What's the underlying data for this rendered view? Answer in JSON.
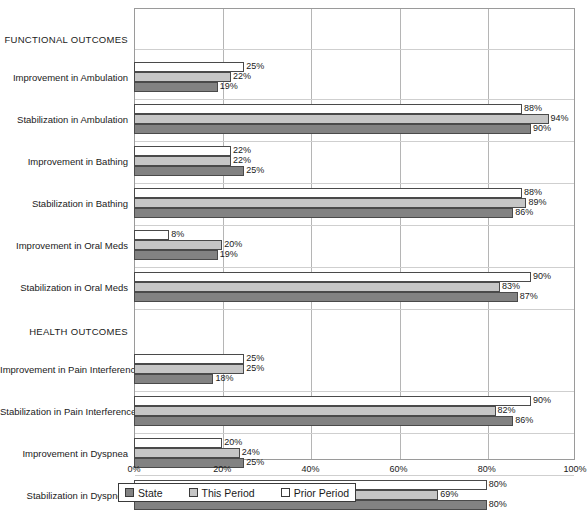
{
  "chart_data": {
    "type": "bar",
    "orientation": "horizontal",
    "title": "",
    "xlabel": "",
    "ylabel": "",
    "xlim": [
      0,
      100
    ],
    "xticks": [
      "0%",
      "20%",
      "40%",
      "60%",
      "80%",
      "100%"
    ],
    "xtick_values": [
      0,
      20,
      40,
      60,
      80,
      100
    ],
    "grid": true,
    "legend_position": "bottom",
    "legend": [
      "State",
      "This Period",
      "Prior Period"
    ],
    "series": [
      {
        "name": "Prior Period",
        "color": "#ffffff",
        "values": [
          25,
          88,
          22,
          88,
          8,
          90,
          25,
          90,
          20,
          80
        ]
      },
      {
        "name": "This Period",
        "color": "#c6c6c6",
        "values": [
          22,
          94,
          22,
          89,
          20,
          83,
          25,
          82,
          24,
          69
        ]
      },
      {
        "name": "State",
        "color": "#828282",
        "values": [
          19,
          90,
          25,
          86,
          19,
          87,
          18,
          86,
          25,
          80
        ]
      }
    ],
    "categories": [
      "Improvement in Ambulation",
      "Stabilization in Ambulation",
      "Improvement in Bathing",
      "Stabilization in Bathing",
      "Improvement in Oral Meds",
      "Stabilization in Oral Meds",
      "Improvement in Pain Interference",
      "Stabilization in Pain Interference",
      "Improvement in Dyspnea",
      "Stabilization in Dyspnea"
    ],
    "sections": [
      {
        "label": "FUNCTIONAL OUTCOMES",
        "categories": [
          0,
          1,
          2,
          3,
          4,
          5
        ]
      },
      {
        "label": "HEALTH OUTCOMES",
        "categories": [
          6,
          7,
          8,
          9
        ]
      }
    ],
    "value_labels": {
      "Improvement in Ambulation": [
        "25%",
        "22%",
        "19%"
      ],
      "Stabilization in Ambulation": [
        "88%",
        "94%",
        "90%"
      ],
      "Improvement in Bathing": [
        "22%",
        "22%",
        "25%"
      ],
      "Stabilization in Bathing": [
        "88%",
        "89%",
        "86%"
      ],
      "Improvement in Oral Meds": [
        "8%",
        "20%",
        "19%"
      ],
      "Stabilization in Oral Meds": [
        "90%",
        "83%",
        "87%"
      ],
      "Improvement in Pain Interference": [
        "25%",
        "25%",
        "18%"
      ],
      "Stabilization in Pain Interference": [
        "90%",
        "82%",
        "86%"
      ],
      "Improvement in Dyspnea": [
        "20%",
        "24%",
        "25%"
      ],
      "Stabilization in Dyspnea": [
        "80%",
        "69%",
        "80%"
      ]
    }
  }
}
